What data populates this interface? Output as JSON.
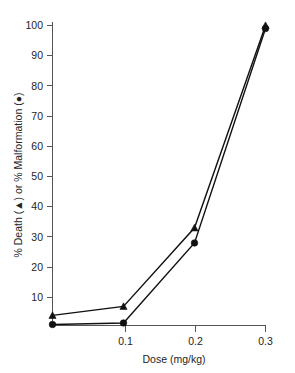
{
  "chart_data": {
    "type": "line",
    "title": "",
    "xlabel": "Dose (mg/kg)",
    "ylabel": "% Death (▲) or % Malformation (●)",
    "xlim": [
      0,
      0.3
    ],
    "ylim": [
      0,
      103
    ],
    "grid": false,
    "legend_position": "none",
    "x": [
      0,
      0.1,
      0.2,
      0.3
    ],
    "xtick_labels": [
      "0.1",
      "0.2",
      "0.3"
    ],
    "xtick_values": [
      0.1,
      0.2,
      0.3
    ],
    "ytick_labels": [
      "10",
      "20",
      "30",
      "40",
      "50",
      "60",
      "70",
      "80",
      "90",
      "100"
    ],
    "ytick_values": [
      10,
      20,
      30,
      40,
      50,
      60,
      70,
      80,
      90,
      100
    ],
    "series": [
      {
        "name": "% Death",
        "marker": "triangle",
        "color": "#111111",
        "values": [
          4,
          7,
          33,
          100
        ]
      },
      {
        "name": "% Malformation",
        "marker": "circle",
        "color": "#111111",
        "values": [
          1,
          1.5,
          28,
          99
        ]
      }
    ]
  },
  "axes": {
    "x_title": "Dose (mg/kg)",
    "y_title": "% Death (▲) or % Malformation (●)"
  },
  "ticks": {
    "y": {
      "t100": "100",
      "t90": "90",
      "t80": "80",
      "t70": "70",
      "t60": "60",
      "t50": "50",
      "t40": "40",
      "t30": "30",
      "t20": "20",
      "t10": "10"
    },
    "x": {
      "t1": "0.1",
      "t2": "0.2",
      "t3": "0.3"
    }
  },
  "colors": {
    "axis": "#555555",
    "ink": "#111111",
    "background": "#ffffff"
  }
}
